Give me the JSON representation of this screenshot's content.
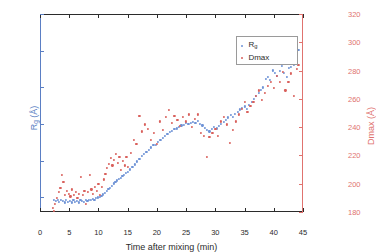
{
  "chart_data": {
    "type": "scatter",
    "title": "",
    "xlabel": "Time after mixing (min)",
    "ylabel": "R_g (Å)",
    "y2label": "Dmax (Å)",
    "xlim": [
      0,
      45
    ],
    "ylim": [
      43,
      70
    ],
    "y2lim": [
      180,
      320
    ],
    "grid": false,
    "legend_position": "top-right",
    "xticks": [
      "0",
      "5",
      "10",
      "15",
      "20",
      "25",
      "30",
      "35",
      "40",
      "45"
    ],
    "xtick_values": [
      0,
      5,
      10,
      15,
      20,
      25,
      30,
      35,
      40,
      45
    ],
    "yticks": [
      "45",
      "50",
      "55",
      "60",
      "65",
      "70"
    ],
    "ytick_values": [
      45,
      50,
      55,
      60,
      65,
      70
    ],
    "y2ticks": [
      "180",
      "200",
      "220",
      "240",
      "260",
      "280",
      "300",
      "320"
    ],
    "y2tick_values": [
      180,
      200,
      220,
      240,
      260,
      280,
      300,
      320
    ],
    "colors": {
      "rg": "#6f93d6",
      "dmax": "#d9605c",
      "axis": "#2b2b2b"
    },
    "series": [
      {
        "name": "R_g",
        "axis": "left",
        "color": "#6f93d6",
        "marker": "dot",
        "points": [
          [
            2.4,
            44.6
          ],
          [
            2.7,
            44.5
          ],
          [
            3.0,
            44.7
          ],
          [
            3.3,
            44.4
          ],
          [
            3.6,
            44.6
          ],
          [
            3.9,
            44.5
          ],
          [
            4.2,
            44.3
          ],
          [
            4.5,
            44.6
          ],
          [
            4.8,
            44.4
          ],
          [
            5.1,
            44.5
          ],
          [
            5.4,
            44.3
          ],
          [
            5.7,
            44.6
          ],
          [
            6.0,
            44.4
          ],
          [
            6.3,
            44.5
          ],
          [
            6.6,
            44.3
          ],
          [
            6.9,
            44.6
          ],
          [
            7.2,
            44.5
          ],
          [
            7.5,
            44.4
          ],
          [
            7.8,
            44.6
          ],
          [
            8.1,
            44.5
          ],
          [
            8.4,
            44.7
          ],
          [
            8.7,
            44.6
          ],
          [
            9.0,
            44.8
          ],
          [
            9.3,
            44.7
          ],
          [
            9.6,
            44.9
          ],
          [
            9.9,
            45.0
          ],
          [
            10.2,
            45.1
          ],
          [
            10.5,
            45.2
          ],
          [
            10.8,
            45.4
          ],
          [
            11.1,
            45.6
          ],
          [
            11.4,
            45.9
          ],
          [
            11.7,
            46.1
          ],
          [
            12.0,
            46.3
          ],
          [
            12.3,
            46.6
          ],
          [
            12.6,
            46.9
          ],
          [
            12.9,
            47.1
          ],
          [
            13.2,
            47.3
          ],
          [
            13.5,
            47.5
          ],
          [
            13.8,
            47.7
          ],
          [
            14.1,
            47.9
          ],
          [
            14.4,
            48.1
          ],
          [
            14.7,
            48.3
          ],
          [
            15.0,
            48.5
          ],
          [
            15.4,
            48.8
          ],
          [
            15.8,
            49.2
          ],
          [
            16.2,
            49.5
          ],
          [
            16.6,
            49.9
          ],
          [
            17.0,
            50.2
          ],
          [
            17.4,
            50.6
          ],
          [
            17.8,
            50.9
          ],
          [
            18.2,
            51.2
          ],
          [
            18.6,
            51.5
          ],
          [
            19.0,
            51.8
          ],
          [
            19.4,
            52.1
          ],
          [
            19.8,
            52.2
          ],
          [
            20.2,
            52.6
          ],
          [
            20.6,
            52.8
          ],
          [
            21.0,
            53.1
          ],
          [
            21.4,
            53.4
          ],
          [
            21.8,
            53.6
          ],
          [
            22.2,
            53.9
          ],
          [
            22.6,
            54.1
          ],
          [
            23.0,
            54.3
          ],
          [
            23.4,
            54.4
          ],
          [
            23.8,
            54.6
          ],
          [
            24.2,
            54.8
          ],
          [
            24.6,
            54.9
          ],
          [
            25.0,
            55.1
          ],
          [
            25.4,
            55.0
          ],
          [
            25.8,
            55.2
          ],
          [
            26.2,
            55.3
          ],
          [
            26.6,
            55.1
          ],
          [
            27.0,
            55.4
          ],
          [
            27.4,
            55.0
          ],
          [
            27.8,
            54.8
          ],
          [
            28.2,
            54.5
          ],
          [
            28.6,
            54.2
          ],
          [
            29.0,
            54.0
          ],
          [
            29.4,
            54.3
          ],
          [
            29.8,
            54.6
          ],
          [
            30.2,
            54.4
          ],
          [
            30.6,
            54.7
          ],
          [
            31.0,
            55.0
          ],
          [
            31.4,
            55.3
          ],
          [
            31.8,
            55.6
          ],
          [
            32.2,
            55.9
          ],
          [
            32.6,
            56.2
          ],
          [
            33.0,
            56.0
          ],
          [
            33.4,
            56.4
          ],
          [
            33.8,
            56.7
          ],
          [
            34.2,
            57.0
          ],
          [
            34.6,
            57.2
          ],
          [
            35.0,
            57.4
          ],
          [
            35.4,
            57.1
          ],
          [
            35.8,
            57.6
          ],
          [
            36.2,
            58.0
          ],
          [
            36.6,
            58.4
          ],
          [
            37.0,
            58.8
          ],
          [
            37.4,
            59.2
          ],
          [
            37.8,
            59.6
          ],
          [
            38.2,
            60.0
          ],
          [
            38.6,
            61.2
          ],
          [
            39.0,
            61.4
          ],
          [
            39.4,
            61.0
          ],
          [
            39.8,
            62.3
          ],
          [
            40.2,
            62.0
          ],
          [
            40.6,
            61.6
          ],
          [
            41.0,
            62.2
          ],
          [
            41.4,
            62.9
          ],
          [
            41.8,
            62.0
          ],
          [
            42.2,
            61.4
          ],
          [
            42.6,
            62.6
          ],
          [
            43.0,
            62.8
          ],
          [
            43.4,
            63.1
          ],
          [
            43.8,
            64.2
          ],
          [
            44.0,
            64.8
          ],
          [
            44.2,
            65.1
          ]
        ]
      },
      {
        "name": "Dmax",
        "axis": "right",
        "color": "#d9605c",
        "marker": "dot",
        "points": [
          [
            2.2,
            183
          ],
          [
            2.4,
            181
          ],
          [
            2.6,
            186
          ],
          [
            2.9,
            190
          ],
          [
            3.2,
            194
          ],
          [
            3.5,
            197
          ],
          [
            3.8,
            206
          ],
          [
            4.0,
            201
          ],
          [
            4.3,
            192
          ],
          [
            4.6,
            195
          ],
          [
            4.9,
            193
          ],
          [
            5.2,
            191
          ],
          [
            5.5,
            196
          ],
          [
            5.8,
            192
          ],
          [
            6.1,
            194
          ],
          [
            6.4,
            190
          ],
          [
            6.7,
            193
          ],
          [
            7.0,
            205
          ],
          [
            7.3,
            192
          ],
          [
            7.6,
            195
          ],
          [
            7.9,
            186
          ],
          [
            8.2,
            194
          ],
          [
            8.5,
            206
          ],
          [
            8.8,
            196
          ],
          [
            9.1,
            193
          ],
          [
            9.4,
            198
          ],
          [
            9.7,
            195
          ],
          [
            10.0,
            200
          ],
          [
            10.3,
            192
          ],
          [
            10.6,
            198
          ],
          [
            10.9,
            203
          ],
          [
            11.2,
            207
          ],
          [
            11.5,
            211
          ],
          [
            11.8,
            214
          ],
          [
            12.1,
            218
          ],
          [
            12.4,
            213
          ],
          [
            12.7,
            217
          ],
          [
            13.0,
            221
          ],
          [
            13.3,
            215
          ],
          [
            13.6,
            219
          ],
          [
            13.9,
            210
          ],
          [
            14.2,
            216
          ],
          [
            14.5,
            213
          ],
          [
            14.8,
            219
          ],
          [
            15.1,
            212
          ],
          [
            15.5,
            222
          ],
          [
            16.0,
            231
          ],
          [
            16.5,
            228
          ],
          [
            17.0,
            248
          ],
          [
            17.5,
            237
          ],
          [
            18.0,
            242
          ],
          [
            18.5,
            239
          ],
          [
            19.0,
            231
          ],
          [
            19.5,
            236
          ],
          [
            20.0,
            228
          ],
          [
            20.5,
            244
          ],
          [
            21.0,
            238
          ],
          [
            21.5,
            247
          ],
          [
            22.0,
            252
          ],
          [
            22.5,
            243
          ],
          [
            23.0,
            248
          ],
          [
            23.5,
            245
          ],
          [
            24.0,
            241
          ],
          [
            24.5,
            247
          ],
          [
            25.0,
            244
          ],
          [
            25.5,
            249
          ],
          [
            26.0,
            240
          ],
          [
            26.5,
            246
          ],
          [
            27.0,
            249
          ],
          [
            27.5,
            236
          ],
          [
            28.0,
            234
          ],
          [
            28.5,
            219
          ],
          [
            29.0,
            233
          ],
          [
            29.5,
            236
          ],
          [
            30.0,
            239
          ],
          [
            30.5,
            234
          ],
          [
            31.0,
            244
          ],
          [
            31.5,
            247
          ],
          [
            32.0,
            242
          ],
          [
            32.5,
            229
          ],
          [
            33.0,
            238
          ],
          [
            33.5,
            244
          ],
          [
            34.0,
            249
          ],
          [
            34.5,
            253
          ],
          [
            35.0,
            258
          ],
          [
            35.5,
            251
          ],
          [
            36.0,
            255
          ],
          [
            36.5,
            258
          ],
          [
            37.0,
            262
          ],
          [
            37.5,
            266
          ],
          [
            38.0,
            259
          ],
          [
            38.5,
            264
          ],
          [
            39.0,
            269
          ],
          [
            39.5,
            272
          ],
          [
            40.0,
            268
          ],
          [
            40.5,
            276
          ],
          [
            41.0,
            272
          ],
          [
            41.5,
            279
          ],
          [
            42.0,
            266
          ],
          [
            42.5,
            272
          ],
          [
            43.0,
            278
          ],
          [
            43.5,
            262
          ],
          [
            44.0,
            281
          ],
          [
            44.2,
            284
          ]
        ]
      }
    ]
  },
  "legend": {
    "items": [
      {
        "label": "R",
        "sub": "g",
        "color": "#6f93d6"
      },
      {
        "label": "Dmax",
        "sub": "",
        "color": "#d9605c"
      }
    ]
  },
  "axis_labels": {
    "x": "Time after mixing (min)",
    "y_left_main": "R",
    "y_left_sub": "g",
    "y_left_unit": " (Å)",
    "y_right": "Dmax (Å)"
  }
}
